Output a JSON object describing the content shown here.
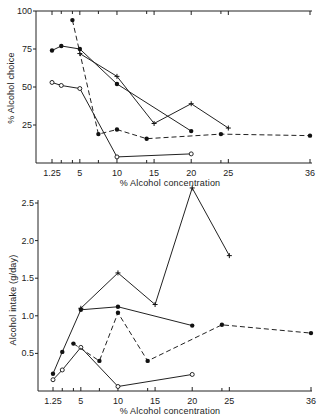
{
  "chart_data": [
    {
      "type": "line",
      "title": "",
      "xlabel": "% Alcohol concentration",
      "ylabel": "% Alcohol choice",
      "xticks": [
        "1.25",
        "5",
        "10",
        "15",
        "20",
        "25",
        "36"
      ],
      "yticks": [
        "25",
        "50",
        "75",
        "100"
      ],
      "xlim": [
        0,
        36
      ],
      "ylim": [
        0,
        100
      ],
      "grid": false,
      "legend": "none",
      "series": [
        {
          "name": "filled-circle-solid",
          "marker": "filled-circle",
          "line": "solid",
          "x": [
            1.25,
            2.5,
            5,
            10,
            20
          ],
          "y": [
            74,
            77,
            75,
            52,
            21
          ]
        },
        {
          "name": "plus-solid",
          "marker": "plus",
          "line": "solid",
          "x": [
            5,
            10,
            15,
            20,
            25
          ],
          "y": [
            72,
            57,
            26,
            39,
            23
          ]
        },
        {
          "name": "open-circle-solid",
          "marker": "open-circle",
          "line": "solid",
          "x": [
            1.25,
            2.5,
            5,
            10,
            20
          ],
          "y": [
            53,
            51,
            49,
            4,
            6
          ]
        },
        {
          "name": "filled-circle-dashed",
          "marker": "filled-circle",
          "line": "dashed",
          "x": [
            4,
            7.5,
            10,
            14,
            24,
            36
          ],
          "y": [
            94,
            19,
            22,
            16,
            19,
            18
          ]
        }
      ]
    },
    {
      "type": "line",
      "title": "",
      "xlabel": "% Alcohol concentration",
      "ylabel": "Alcohol intake (g/day)",
      "xticks": [
        "1.25",
        "5",
        "10",
        "15",
        "20",
        "25",
        "36"
      ],
      "yticks": [
        "0.5",
        "1.0",
        "1.5",
        "2.0",
        "2.5"
      ],
      "xlim": [
        0,
        36
      ],
      "ylim": [
        0,
        2.5
      ],
      "grid": false,
      "legend": "none",
      "series": [
        {
          "name": "plus-solid",
          "marker": "plus",
          "line": "solid",
          "x": [
            5,
            10,
            15,
            20,
            25
          ],
          "y": [
            1.1,
            1.57,
            1.15,
            2.7,
            1.8
          ]
        },
        {
          "name": "filled-circle-solid",
          "marker": "filled-circle",
          "line": "solid",
          "x": [
            1.25,
            2.5,
            5,
            10,
            20
          ],
          "y": [
            0.23,
            0.52,
            1.08,
            1.12,
            0.87
          ]
        },
        {
          "name": "open-circle-solid",
          "marker": "open-circle",
          "line": "solid",
          "x": [
            1.25,
            2.5,
            5,
            10,
            20
          ],
          "y": [
            0.15,
            0.28,
            0.58,
            0.06,
            0.22
          ]
        },
        {
          "name": "filled-circle-dashed",
          "marker": "filled-circle",
          "line": "dashed",
          "x": [
            4,
            7.5,
            10,
            14,
            24,
            36
          ],
          "y": [
            0.63,
            0.4,
            1.04,
            0.4,
            0.88,
            0.77
          ]
        }
      ]
    }
  ]
}
